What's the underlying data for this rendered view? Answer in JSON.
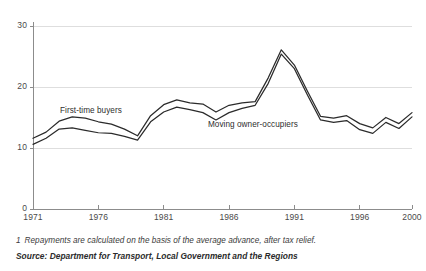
{
  "chart_data": {
    "type": "line",
    "title": "",
    "xlabel": "",
    "ylabel": "",
    "xlim": [
      1971,
      2000
    ],
    "ylim": [
      0,
      30
    ],
    "grid": true,
    "gridlines_y": [
      10,
      20,
      30
    ],
    "legend_position": "inline-annotation",
    "x": [
      1971,
      1972,
      1973,
      1974,
      1975,
      1976,
      1977,
      1978,
      1979,
      1980,
      1981,
      1982,
      1983,
      1984,
      1985,
      1986,
      1987,
      1988,
      1989,
      1990,
      1991,
      1992,
      1993,
      1994,
      1995,
      1996,
      1997,
      1998,
      1999,
      2000
    ],
    "y_ticks": [
      0,
      10,
      20,
      30
    ],
    "x_ticks": [
      1971,
      1976,
      1981,
      1986,
      1991,
      1996,
      2000
    ],
    "y_tick_labels": [
      "0",
      "10",
      "20",
      "30"
    ],
    "x_tick_labels": [
      "1971",
      "1976",
      "1981",
      "1986",
      "1991",
      "1996",
      "2000"
    ],
    "series": [
      {
        "name": "First-time buyers",
        "color": "#2b2b2b",
        "values": [
          11.6,
          12.6,
          14.4,
          15.1,
          14.9,
          14.3,
          13.9,
          13.1,
          12.0,
          15.3,
          17.1,
          17.9,
          17.4,
          17.2,
          15.9,
          17.0,
          17.4,
          17.6,
          21.5,
          26.1,
          23.6,
          19.3,
          15.2,
          14.9,
          15.3,
          14.0,
          13.3,
          15.0,
          14.0,
          15.8
        ]
      },
      {
        "name": "Moving owner-occupiers",
        "color": "#2b2b2b",
        "values": [
          10.6,
          11.6,
          13.1,
          13.3,
          12.9,
          12.5,
          12.4,
          11.9,
          11.3,
          14.3,
          15.9,
          16.7,
          16.3,
          15.8,
          14.6,
          15.8,
          16.5,
          17.0,
          20.6,
          25.4,
          23.0,
          18.7,
          14.6,
          14.2,
          14.5,
          13.0,
          12.4,
          14.2,
          13.2,
          15.1
        ]
      }
    ],
    "annotations": [
      {
        "text": "First-time buyers",
        "x_px": 60,
        "y_px": 106
      },
      {
        "text": "Moving owner-occupiers",
        "x_px": 208,
        "y_px": 120
      }
    ]
  },
  "footnote": {
    "marker": "1",
    "text": "Repayments are calculated on the basis of the average advance, after tax relief."
  },
  "source": {
    "text": "Source: Department for Transport, Local Government and the Regions"
  },
  "colors": {
    "line": "#2b2b2b",
    "axis": "#8c8c8c",
    "grid": "#dedede",
    "text": "#3b3b3b",
    "background": "#ffffff"
  }
}
